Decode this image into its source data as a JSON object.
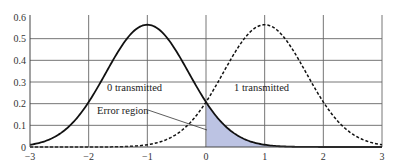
{
  "chart_data": {
    "type": "line",
    "title": "",
    "xlabel": "",
    "ylabel": "",
    "xlim": [
      -3,
      3
    ],
    "ylim": [
      0,
      0.6
    ],
    "grid": true,
    "x_ticks": [
      "-3",
      "-2",
      "-1",
      "0",
      "1",
      "2",
      "3"
    ],
    "y_ticks": [
      "0",
      "0.1",
      "0.2",
      "0.3",
      "0.4",
      "0.5",
      "0.6"
    ],
    "series": [
      {
        "name": "0 transmitted",
        "style": "solid",
        "mean": -1,
        "sigma": 0.707,
        "peak": 0.56,
        "x": [
          -3,
          -2,
          -1,
          0,
          1,
          2,
          3
        ],
        "values": [
          0.01,
          0.21,
          0.56,
          0.21,
          0.01,
          0.0,
          0.0
        ]
      },
      {
        "name": "1 transmitted",
        "style": "dashed",
        "mean": 1,
        "sigma": 0.707,
        "peak": 0.56,
        "x": [
          -3,
          -2,
          -1,
          0,
          1,
          2,
          3
        ],
        "values": [
          0.0,
          0.0,
          0.01,
          0.21,
          0.56,
          0.21,
          0.01
        ]
      }
    ],
    "annotations": [
      {
        "text": "0 transmitted",
        "x": -1,
        "y": 0.3
      },
      {
        "text": "1 transmitted",
        "x": 1,
        "y": 0.3
      },
      {
        "text": "Error region",
        "x": -1,
        "y": 0.19,
        "points_to": "shaded area right of x=0 under solid curve"
      }
    ],
    "shaded_region": {
      "label": "Error region",
      "x_from": 0,
      "x_to": 3,
      "under": "0 transmitted",
      "color": "#b8bfe0"
    }
  },
  "labels": {
    "zero_tx": "0 transmitted",
    "one_tx": "1 transmitted",
    "error_region": "Error region"
  },
  "ticks": {
    "x": [
      "−3",
      "−2",
      "−1",
      "0",
      "1",
      "2",
      "3"
    ],
    "y": [
      "0",
      "0.1",
      "0.2",
      "0.3",
      "0.4",
      "0.5",
      "0.6"
    ]
  }
}
